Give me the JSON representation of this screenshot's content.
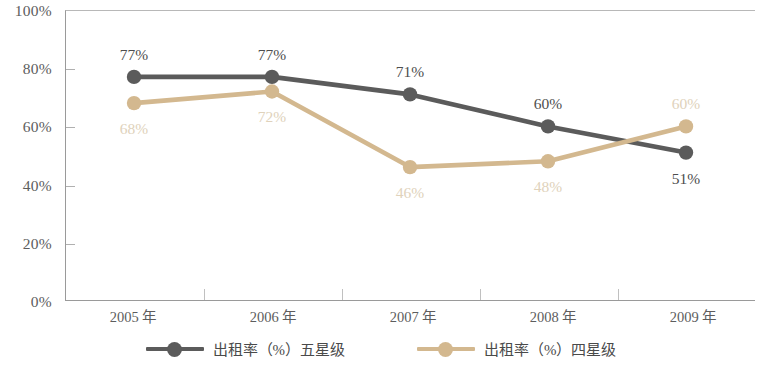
{
  "chart_data": {
    "type": "line",
    "title": "",
    "subtitle": "",
    "xlabel": "",
    "ylabel": "",
    "categories": [
      "2005 年",
      "2006 年",
      "2007 年",
      "2008 年",
      "2009 年"
    ],
    "ylim": [
      0,
      100
    ],
    "yticks": [
      0,
      20,
      40,
      60,
      80,
      100
    ],
    "ytick_labels": [
      "0%",
      "20%",
      "40%",
      "60%",
      "80%",
      "100%"
    ],
    "grid": false,
    "legend_position": "bottom",
    "series": [
      {
        "name": "出租率（%）五星级",
        "color": "#5b5b5b",
        "label_color": "#4e4e4e",
        "values": [
          77,
          77,
          71,
          60,
          51
        ],
        "point_labels": [
          "77%",
          "77%",
          "71%",
          "60%",
          "51%"
        ],
        "label_side": [
          "above",
          "above",
          "above",
          "above",
          "below"
        ]
      },
      {
        "name": "出租率（%）四星级",
        "color": "#d3b88f",
        "label_color": "#e0d2bb",
        "values": [
          68,
          72,
          46,
          48,
          60
        ],
        "point_labels": [
          "68%",
          "72%",
          "46%",
          "48%",
          "60%"
        ],
        "label_side": [
          "below",
          "below",
          "below",
          "below",
          "above"
        ]
      }
    ]
  },
  "axis": {
    "y_labels": [
      "100%",
      "80%",
      "60%",
      "40%",
      "20%",
      "0%"
    ],
    "x_labels": [
      "2005 年",
      "2006 年",
      "2007 年",
      "2008 年",
      "2009 年"
    ]
  },
  "legend": {
    "items": [
      {
        "label": "出租率（%）五星级",
        "color": "#5b5b5b"
      },
      {
        "label": "出租率（%）四星级",
        "color": "#d3b88f"
      }
    ]
  }
}
